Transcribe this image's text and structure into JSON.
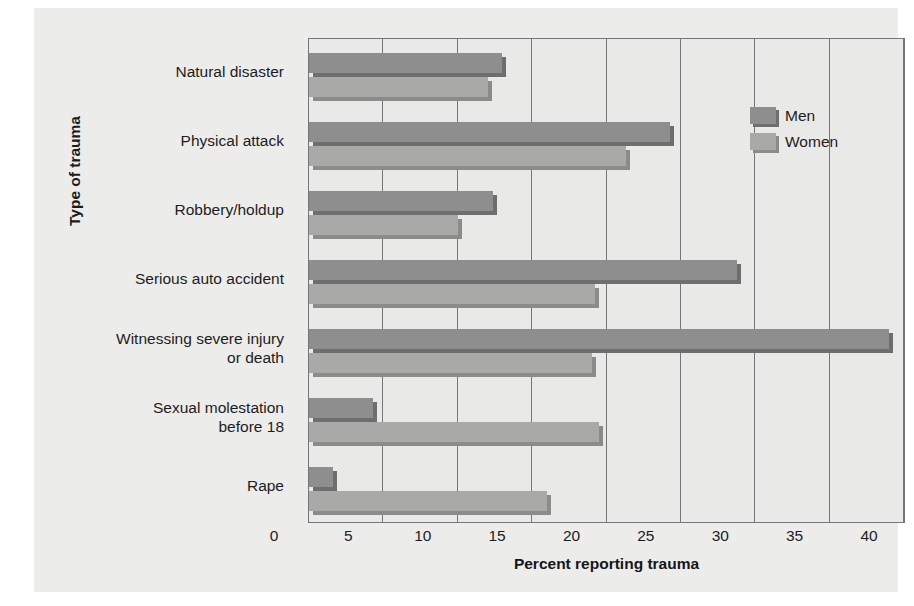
{
  "chart_data": {
    "type": "bar",
    "orientation": "horizontal",
    "title": "",
    "xlabel": "Percent reporting trauma",
    "ylabel": "Type of trauma",
    "xlim": [
      0,
      40
    ],
    "xticks": [
      0,
      5,
      10,
      15,
      20,
      25,
      30,
      35,
      40
    ],
    "xtick_labels": [
      "0",
      "5",
      "10",
      "15",
      "20",
      "25",
      "30",
      "35",
      "40"
    ],
    "grid": "vertical",
    "legend_position": "top-right",
    "categories": [
      "Natural disaster",
      "Physical attack",
      "Robbery/holdup",
      "Serious auto accident",
      "Witnessing severe injury or death",
      "Sexual molestation before 18",
      "Rape"
    ],
    "category_lines": [
      [
        "Natural disaster"
      ],
      [
        "Physical attack"
      ],
      [
        "Robbery/holdup"
      ],
      [
        "Serious auto accident"
      ],
      [
        "Witnessing severe injury",
        "or death"
      ],
      [
        "Sexual molestation",
        "before 18"
      ],
      [
        "Rape"
      ]
    ],
    "series": [
      {
        "name": "Men",
        "color": "#8e8e8e",
        "values": [
          13.0,
          24.3,
          12.4,
          28.8,
          39.0,
          4.3,
          1.6
        ]
      },
      {
        "name": "Women",
        "color": "#a9a9a8",
        "values": [
          12.0,
          21.3,
          10.0,
          19.2,
          19.0,
          19.5,
          16.0
        ]
      }
    ]
  },
  "legend": {
    "items": [
      {
        "label": "Men"
      },
      {
        "label": "Women"
      }
    ]
  },
  "axes": {
    "x_title": "Percent reporting trauma",
    "y_title": "Type of trauma"
  }
}
